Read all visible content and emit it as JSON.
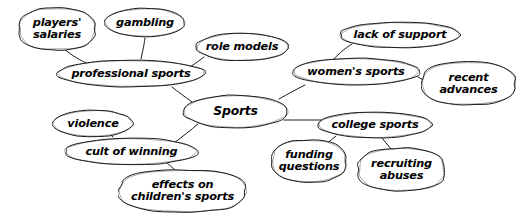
{
  "diagram": {
    "type": "concept-map",
    "title_node": "Sports",
    "style": {
      "stroke": "#1a1a1a",
      "fill": "#ffffff",
      "background": "#ffffff",
      "stroke_width": 1.0
    },
    "nodes": [
      {
        "id": "players-salaries",
        "label": "players'\nsalaries",
        "x": 18,
        "y": 7,
        "w": 78,
        "h": 44,
        "shape": "blob",
        "lines": 2
      },
      {
        "id": "gambling",
        "label": "gambling",
        "x": 104,
        "y": 7,
        "w": 82,
        "h": 31,
        "shape": "oval",
        "lines": 1
      },
      {
        "id": "role-models",
        "label": "role models",
        "x": 195,
        "y": 32,
        "w": 94,
        "h": 30,
        "shape": "oval",
        "lines": 1
      },
      {
        "id": "lack-of-support",
        "label": "lack of support",
        "x": 339,
        "y": 21,
        "w": 122,
        "h": 28,
        "shape": "oval",
        "lines": 1
      },
      {
        "id": "professional-sports",
        "label": "professional sports",
        "x": 56,
        "y": 59,
        "w": 150,
        "h": 29,
        "shape": "oval",
        "lines": 1
      },
      {
        "id": "womens-sports",
        "label": "women's sports",
        "x": 291,
        "y": 57,
        "w": 130,
        "h": 29,
        "shape": "oval",
        "lines": 1
      },
      {
        "id": "recent-advances",
        "label": "recent\nadvances",
        "x": 421,
        "y": 61,
        "w": 95,
        "h": 45,
        "shape": "blob",
        "lines": 2
      },
      {
        "id": "sports",
        "label": "Sports",
        "x": 182,
        "y": 94,
        "w": 107,
        "h": 35,
        "shape": "oval",
        "lines": 1
      },
      {
        "id": "violence",
        "label": "violence",
        "x": 52,
        "y": 109,
        "w": 82,
        "h": 29,
        "shape": "oval",
        "lines": 1
      },
      {
        "id": "college-sports",
        "label": "college sports",
        "x": 317,
        "y": 111,
        "w": 116,
        "h": 28,
        "shape": "oval",
        "lines": 1
      },
      {
        "id": "cult-of-winning",
        "label": "cult of winning",
        "x": 64,
        "y": 137,
        "w": 135,
        "h": 29,
        "shape": "oval",
        "lines": 1
      },
      {
        "id": "funding-questions",
        "label": "funding\nquestions",
        "x": 271,
        "y": 139,
        "w": 76,
        "h": 44,
        "shape": "blob",
        "lines": 2
      },
      {
        "id": "recruiting-abuses",
        "label": "recruiting\nabuses",
        "x": 357,
        "y": 147,
        "w": 89,
        "h": 45,
        "shape": "blob",
        "lines": 2
      },
      {
        "id": "effects-childrens",
        "label": "effects on\nchildren's sports",
        "x": 118,
        "y": 169,
        "w": 129,
        "h": 44,
        "shape": "blob",
        "lines": 2
      }
    ],
    "edges": [
      {
        "from": "players-salaries",
        "to": "professional-sports"
      },
      {
        "from": "gambling",
        "to": "professional-sports"
      },
      {
        "from": "role-models",
        "to": "professional-sports"
      },
      {
        "from": "professional-sports",
        "to": "sports"
      },
      {
        "from": "sports",
        "to": "womens-sports"
      },
      {
        "from": "womens-sports",
        "to": "lack-of-support"
      },
      {
        "from": "womens-sports",
        "to": "recent-advances"
      },
      {
        "from": "sports",
        "to": "college-sports"
      },
      {
        "from": "college-sports",
        "to": "funding-questions"
      },
      {
        "from": "college-sports",
        "to": "recruiting-abuses"
      },
      {
        "from": "sports",
        "to": "cult-of-winning"
      },
      {
        "from": "cult-of-winning",
        "to": "violence"
      },
      {
        "from": "cult-of-winning",
        "to": "effects-childrens"
      }
    ],
    "edge_paths": [
      {
        "name": "players-salaries--professional-sports",
        "d": "M 63 48 C 70 54 76 58 86 63"
      },
      {
        "name": "gambling--professional-sports",
        "d": "M 145 38 C 144 45 143 50 141 59"
      },
      {
        "name": "role-models--professional-sports",
        "d": "M 204 57 C 200 60 196 63 190 67"
      },
      {
        "name": "professional-sports--sports",
        "d": "M 172 87 C 178 92 184 96 192 102"
      },
      {
        "name": "sports--womens-sports",
        "d": "M 279 99 C 288 94 295 90 305 85"
      },
      {
        "name": "womens-sports--lack-of-support",
        "d": "M 333 60 C 340 52 346 48 352 44"
      },
      {
        "name": "womens-sports--recent-advances",
        "d": "M 418 77 C 425 81 430 84 436 88"
      },
      {
        "name": "sports--college-sports",
        "d": "M 284 120 C 298 120 310 120 325 120"
      },
      {
        "name": "college-sports--funding-questions",
        "d": "M 336 136 C 330 141 325 145 318 150"
      },
      {
        "name": "college-sports--recruiting-abuses",
        "d": "M 382 138 C 387 144 391 149 396 155"
      },
      {
        "name": "sports--cult-of-winning",
        "d": "M 198 124 C 190 131 183 136 174 143"
      },
      {
        "name": "cult-of-winning--violence",
        "d": "M 113 137 C 110 134 107 132 103 129"
      },
      {
        "name": "cult-of-winning--effects-childrens",
        "d": "M 167 163 C 172 167 176 171 181 176"
      }
    ]
  }
}
